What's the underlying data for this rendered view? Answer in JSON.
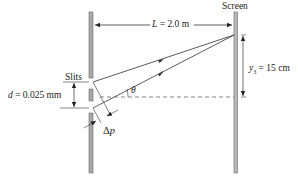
{
  "labels": {
    "screen": "Screen",
    "slits": "Slits",
    "L_symbol": "L",
    "L_value": " = 2.0 m",
    "y_symbol": "y",
    "y_subscript": "3",
    "y_value": " = 15 cm",
    "d_symbol": "d",
    "d_value": " = 0.025 mm",
    "theta": "θ",
    "delta_p_delta": "Δ",
    "delta_p_symbol": "p"
  },
  "colors": {
    "barrier": "#a8a8a8",
    "barrier_edge": "#6a6a6a",
    "line": "#333333",
    "dashed": "#555555"
  }
}
